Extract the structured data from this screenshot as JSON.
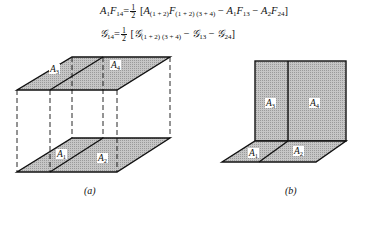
{
  "equations": {
    "eq1": {
      "lhs": "A",
      "lhs_sub": "1",
      "lhs_f": "F",
      "lhs_f_sub": "14",
      "equals": "=",
      "frac_num": "1",
      "frac_den": "2",
      "open": "[",
      "t1_a": "A",
      "t1_a_sub": "(1 + 2)",
      "t1_f": "F",
      "t1_f_sub": "(1 + 2) (3 + 4)",
      "minus1": " − ",
      "t2_a": "A",
      "t2_a_sub": "1",
      "t2_f": "F",
      "t2_f_sub": "13",
      "minus2": " − ",
      "t3_a": "A",
      "t3_a_sub": "2",
      "t3_f": "F",
      "t3_f_sub": "24",
      "close": "]"
    },
    "eq2": {
      "lhs": "𝒢",
      "lhs_sub": "14",
      "equals": "=",
      "frac_num": "1",
      "frac_den": "2",
      "open": "[",
      "t1": "𝒢",
      "t1_sub": "(1 + 2) (3 + 4)",
      "minus1": " − ",
      "t2": "𝒢",
      "t2_sub": "13",
      "minus2": " − ",
      "t3": "𝒢",
      "t3_sub": "24",
      "close": "]"
    }
  },
  "figure_a": {
    "caption": "(a)",
    "labels": [
      {
        "name": "A",
        "sub": "3"
      },
      {
        "name": "A",
        "sub": "4"
      },
      {
        "name": "A",
        "sub": "1"
      },
      {
        "name": "A",
        "sub": "2"
      }
    ]
  },
  "figure_b": {
    "caption": "(b)",
    "labels": [
      {
        "name": "A",
        "sub": "3"
      },
      {
        "name": "A",
        "sub": "4"
      },
      {
        "name": "A",
        "sub": "1"
      },
      {
        "name": "A",
        "sub": "2"
      }
    ]
  },
  "colors": {
    "fill": "#b8b8b8",
    "line": "#111111"
  }
}
